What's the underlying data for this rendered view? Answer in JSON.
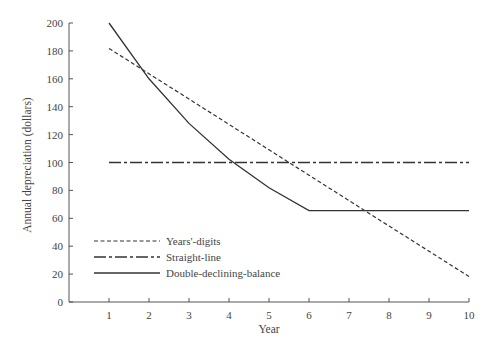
{
  "chart_data": {
    "type": "line",
    "title": "",
    "xlabel": "Year",
    "ylabel": "Annual depreciation (dollars)",
    "x": [
      1,
      2,
      3,
      4,
      5,
      6,
      7,
      8,
      9,
      10
    ],
    "xlim": [
      0,
      10
    ],
    "ylim": [
      0,
      200
    ],
    "x_ticks": [
      "1",
      "2",
      "3",
      "4",
      "5",
      "6",
      "7",
      "8",
      "9",
      "10"
    ],
    "y_ticks": [
      "0",
      "20",
      "40",
      "60",
      "80",
      "100",
      "120",
      "140",
      "160",
      "180",
      "200"
    ],
    "grid": false,
    "legend_position": "lower-left",
    "series": [
      {
        "name": "Years'-digits",
        "style": "dashed",
        "values": [
          181.8,
          163.6,
          145.5,
          127.3,
          109.1,
          90.9,
          72.7,
          54.5,
          36.4,
          18.2
        ]
      },
      {
        "name": "Straight-line",
        "style": "dash-dot",
        "values": [
          100,
          100,
          100,
          100,
          100,
          100,
          100,
          100,
          100,
          100
        ]
      },
      {
        "name": "Double-declining-balance",
        "style": "solid",
        "values": [
          200,
          160,
          128,
          102.4,
          81.9,
          65.5,
          65.5,
          65.5,
          65.5,
          65.5
        ]
      }
    ]
  }
}
